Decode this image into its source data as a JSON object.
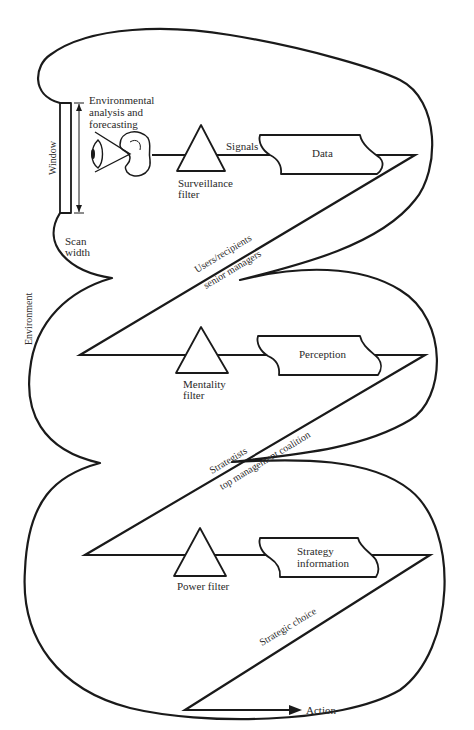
{
  "diagram": {
    "type": "flow",
    "environment_label": "Environment",
    "scanner": {
      "window_label": "Window",
      "scan_width_label": "Scan width",
      "analysis_label_lines": [
        "Environmental",
        "analysis and",
        "forecasting"
      ]
    },
    "stages": [
      {
        "filter_label_lines": [
          "Surveillance",
          "filter"
        ],
        "edge_label": "Signals",
        "output_label_lines": [
          "Data"
        ],
        "transition_label_lines": [
          "Users/recipients",
          "senior managers"
        ]
      },
      {
        "filter_label_lines": [
          "Mentality",
          "filter"
        ],
        "output_label_lines": [
          "Perception"
        ],
        "transition_label_lines": [
          "Strategists",
          "top management coalition"
        ]
      },
      {
        "filter_label_lines": [
          "Power filter"
        ],
        "output_label_lines": [
          "Strategy",
          "information"
        ],
        "transition_label_lines": [
          "Strategic choice"
        ]
      }
    ],
    "final_output_label": "Action",
    "icons": [
      "eye-icon",
      "ear-icon",
      "filter-triangle-icon",
      "data-document-icon",
      "arrow-icon"
    ]
  }
}
